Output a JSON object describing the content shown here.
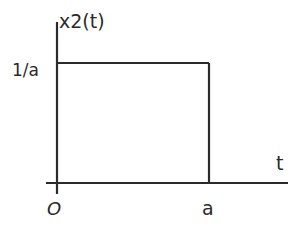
{
  "diagram": {
    "type": "signal-plot",
    "function_label": "x2(t)",
    "x_axis_label": "t",
    "y_level_label": "1/a",
    "origin_label": "O",
    "x_end_label": "a",
    "shape": "rectangular pulse",
    "pulse": {
      "start": "0",
      "end": "a",
      "height": "1/a"
    },
    "colors": {
      "stroke": "#2a2a2a",
      "background": "#ffffff"
    }
  }
}
